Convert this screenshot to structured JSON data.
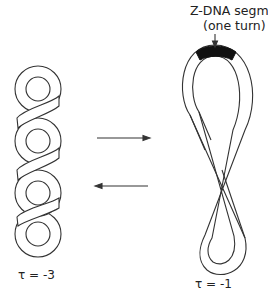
{
  "diagram": {
    "annotation": {
      "line1": "Z-DNA segment",
      "line2": "(one turn)"
    },
    "left_structure": {
      "label": "τ = -3",
      "description": "plectonemic supercoil with three crossings"
    },
    "right_structure": {
      "label": "τ = -1",
      "description": "figure-eight loop with one crossing, black Z-DNA segment at top"
    },
    "arrows": {
      "forward": "right",
      "reverse": "left"
    },
    "colors": {
      "line": "#333333",
      "zdna_fill": "#111111",
      "background": "#ffffff"
    }
  }
}
